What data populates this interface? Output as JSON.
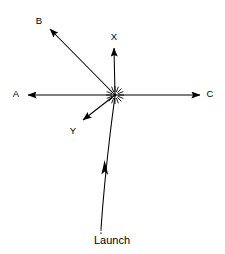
{
  "figure": {
    "background_color": "#ffffff",
    "stroke_color": "#000000",
    "width": 225,
    "height": 254
  },
  "origin": {
    "marker": "burst-icon",
    "label": "burst point",
    "x": 115,
    "y": 95
  },
  "vectors": [
    {
      "id": "b",
      "label": "B",
      "from_x": 115,
      "from_y": 95,
      "to_x": 50,
      "to_y": 29,
      "label_x": 39,
      "label_y": 21,
      "direction": "up-left"
    },
    {
      "id": "x",
      "label": "X",
      "from_x": 115,
      "from_y": 95,
      "to_x": 114,
      "to_y": 48,
      "label_x": 114,
      "label_y": 37,
      "direction": "up"
    },
    {
      "id": "a",
      "label": "A",
      "from_x": 115,
      "from_y": 95,
      "to_x": 28,
      "to_y": 95,
      "label_x": 16,
      "label_y": 94,
      "direction": "left"
    },
    {
      "id": "c",
      "label": "C",
      "from_x": 115,
      "from_y": 95,
      "to_x": 200,
      "to_y": 95,
      "label_x": 210,
      "label_y": 94,
      "direction": "right"
    },
    {
      "id": "y",
      "label": "Y",
      "from_x": 115,
      "from_y": 95,
      "to_x": 83,
      "to_y": 120,
      "label_x": 73,
      "label_y": 131,
      "direction": "down-left"
    }
  ],
  "trajectory": {
    "id": "launch-trajectory",
    "label": "Launch",
    "label_x": 112,
    "label_y": 241,
    "path": "M 101 230 C 103 200 107 160 110 135 C 112 118 114 104 115 96",
    "dashed_tail": "M 101 233 L 101 229",
    "arrow_x": 104,
    "arrow_y": 163,
    "direction": "up"
  }
}
